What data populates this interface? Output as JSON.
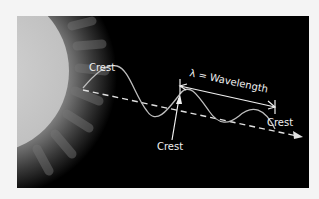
{
  "diagram": {
    "labels": {
      "crest_left": "Crest",
      "crest_middle": "Crest",
      "crest_right": "Crest",
      "wavelength": "λ = Wavelength"
    },
    "colors": {
      "background": "#000000",
      "page": "#f4f4f4",
      "sun": "#c8c8c8",
      "wave": "#bdbdbd",
      "text": "#f0f0f0"
    },
    "elements": [
      "sun",
      "sine-wave",
      "dashed-direction-arrow",
      "wavelength-arrow"
    ]
  }
}
